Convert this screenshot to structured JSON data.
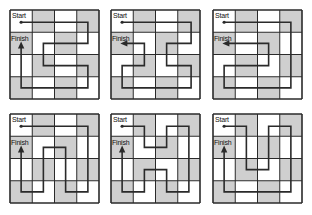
{
  "labels": {
    "start": "Start",
    "finish": "Finish"
  },
  "colors": {
    "shade": "#cfcfcf",
    "light": "#ffffff",
    "grid_line": "#2a2a2a",
    "path": "#2a2a2a"
  },
  "grid": {
    "rows": 4,
    "cols": 4,
    "shading": [
      [
        0,
        1,
        0,
        1
      ],
      [
        1,
        0,
        1,
        0
      ],
      [
        0,
        1,
        0,
        1
      ],
      [
        1,
        0,
        1,
        0
      ]
    ]
  },
  "mazes": [
    {
      "id": "maze-1",
      "x": 10,
      "y": 10,
      "size": 89,
      "arrow": "up",
      "path": [
        [
          0.5,
          0.55
        ],
        [
          3.5,
          0.55
        ],
        [
          3.5,
          1.5
        ],
        [
          1.5,
          1.5
        ],
        [
          1.5,
          2.5
        ],
        [
          3.5,
          2.5
        ],
        [
          3.5,
          3.5
        ],
        [
          0.5,
          3.5
        ],
        [
          0.5,
          1.6
        ]
      ]
    },
    {
      "id": "maze-2",
      "x": 111,
      "y": 10,
      "size": 89,
      "arrow": "left",
      "path": [
        [
          0.5,
          0.55
        ],
        [
          3.6,
          0.55
        ],
        [
          3.6,
          1.5
        ],
        [
          2.5,
          1.5
        ],
        [
          2.5,
          2.5
        ],
        [
          3.6,
          2.5
        ],
        [
          3.6,
          3.5
        ],
        [
          0.5,
          3.5
        ],
        [
          0.5,
          2.5
        ],
        [
          1.5,
          2.5
        ],
        [
          1.5,
          1.5
        ],
        [
          0.6,
          1.5
        ]
      ]
    },
    {
      "id": "maze-3",
      "x": 213,
      "y": 10,
      "size": 89,
      "arrow": "left",
      "path": [
        [
          0.5,
          0.55
        ],
        [
          3.5,
          0.55
        ],
        [
          3.5,
          3.5
        ],
        [
          0.5,
          3.5
        ],
        [
          0.5,
          2.5
        ],
        [
          2.5,
          2.5
        ],
        [
          2.5,
          1.5
        ],
        [
          0.6,
          1.5
        ]
      ]
    },
    {
      "id": "maze-4",
      "x": 10,
      "y": 114,
      "size": 89,
      "arrow": "up",
      "path": [
        [
          0.5,
          0.55
        ],
        [
          3.5,
          0.55
        ],
        [
          3.5,
          3.5
        ],
        [
          2.5,
          3.5
        ],
        [
          2.5,
          1.5
        ],
        [
          1.5,
          1.5
        ],
        [
          1.5,
          3.5
        ],
        [
          0.5,
          3.5
        ],
        [
          0.5,
          1.6
        ]
      ]
    },
    {
      "id": "maze-5",
      "x": 111,
      "y": 114,
      "size": 89,
      "arrow": "up",
      "path": [
        [
          0.5,
          0.55
        ],
        [
          1.5,
          0.55
        ],
        [
          1.5,
          1.5
        ],
        [
          2.5,
          1.5
        ],
        [
          2.5,
          0.55
        ],
        [
          3.5,
          0.55
        ],
        [
          3.5,
          3.5
        ],
        [
          2.5,
          3.5
        ],
        [
          2.5,
          2.5
        ],
        [
          1.5,
          2.5
        ],
        [
          1.5,
          3.5
        ],
        [
          0.5,
          3.5
        ],
        [
          0.5,
          1.6
        ]
      ]
    },
    {
      "id": "maze-6",
      "x": 213,
      "y": 114,
      "size": 89,
      "arrow": "up",
      "path": [
        [
          0.5,
          0.55
        ],
        [
          1.5,
          0.55
        ],
        [
          1.5,
          2.5
        ],
        [
          2.5,
          2.5
        ],
        [
          2.5,
          0.55
        ],
        [
          3.5,
          0.55
        ],
        [
          3.5,
          3.5
        ],
        [
          0.5,
          3.5
        ],
        [
          0.5,
          1.6
        ]
      ]
    }
  ]
}
